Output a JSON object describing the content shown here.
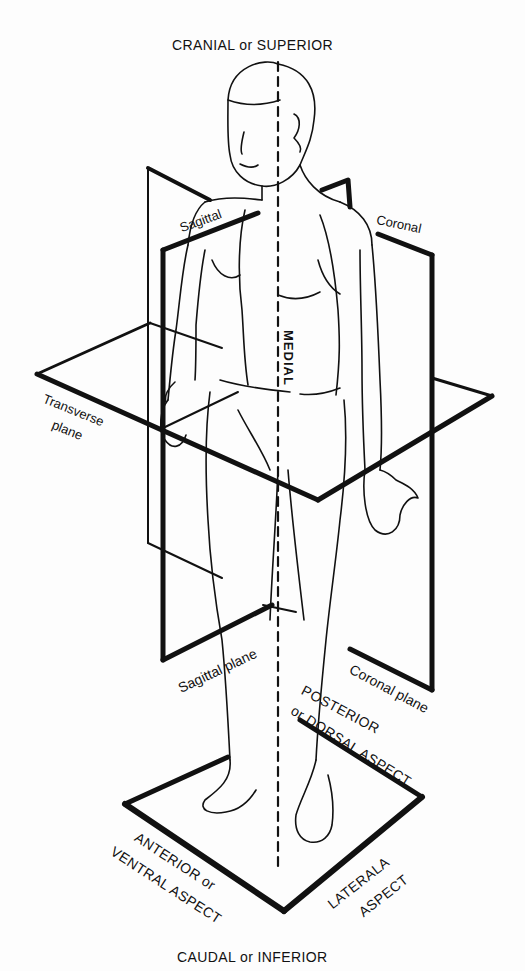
{
  "figure": {
    "title_top": "CRANIAL or SUPERIOR",
    "title_bottom": "CAUDAL or INFERIOR",
    "colors": {
      "background": "#fdfdfd",
      "line": "#111111"
    },
    "labels": {
      "sagittal_upper": "Sagittal",
      "coronal_upper": "Coronal",
      "medial": "MEDIAL",
      "transverse_line1": "Transverse",
      "transverse_line2": "plane",
      "sagittal_plane": "Sagittal plane",
      "coronal_plane": "Coronal plane",
      "posterior_line1": "POSTERIOR",
      "posterior_line2": "or DORSAL ASPECT",
      "anterior_line1": "ANTERIOR or",
      "anterior_line2": "VENTRAL ASPECT",
      "lateral_line1": "LATERALA",
      "lateral_line2": "ASPECT"
    },
    "elements": [
      "human-figure-outline",
      "sagittal-plane",
      "coronal-plane",
      "transverse-plane",
      "ground-plane",
      "medial-axis-dashed-line"
    ]
  }
}
